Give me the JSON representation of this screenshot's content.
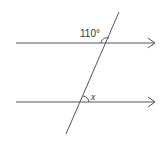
{
  "diagram": {
    "type": "parallel-lines-transversal",
    "line_color": "#555555",
    "labels": {
      "given_angle": "110°",
      "unknown_angle": "x"
    },
    "lines": [
      {
        "name": "upper-parallel-line",
        "x1": 16,
        "y1": 43,
        "x2": 155,
        "y2": 43,
        "arrow": true
      },
      {
        "name": "lower-parallel-line",
        "x1": 16,
        "y1": 102,
        "x2": 155,
        "y2": 102,
        "arrow": true
      },
      {
        "name": "transversal",
        "x1": 119,
        "y1": 12,
        "x2": 66,
        "y2": 134
      }
    ]
  }
}
